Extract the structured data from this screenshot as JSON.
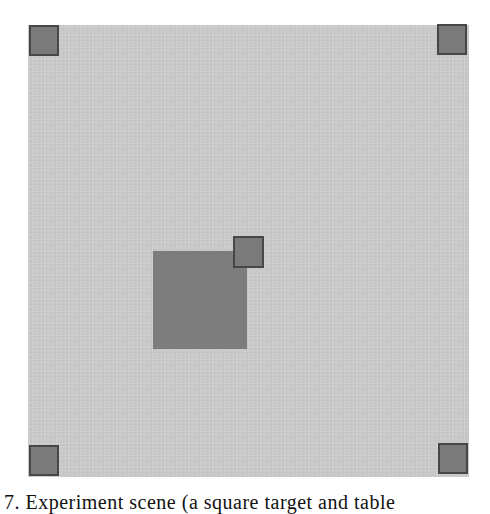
{
  "figure": {
    "caption": "7. Experiment scene (a square target and table",
    "colors": {
      "scene_background": "#c9c9c9",
      "marker_fill": "#7a7a7a",
      "marker_border": "#474747",
      "target_fill": "#7d7d7d"
    },
    "scene": {
      "x": 28,
      "y": 25,
      "width": 441,
      "height": 452
    },
    "markers": [
      {
        "name": "top-left",
        "x": 29,
        "y": 25
      },
      {
        "name": "top-right",
        "x": 437,
        "y": 24
      },
      {
        "name": "bottom-left",
        "x": 29,
        "y": 445
      },
      {
        "name": "bottom-right",
        "x": 438,
        "y": 443
      },
      {
        "name": "center",
        "x": 233,
        "y": 236
      }
    ],
    "target": {
      "x": 153,
      "y": 251,
      "width": 94,
      "height": 98
    }
  }
}
